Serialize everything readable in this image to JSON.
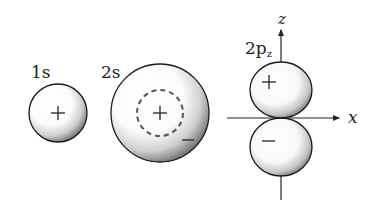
{
  "diagram": {
    "orbitals": [
      {
        "id": "1s",
        "label": "1s",
        "signs": [
          "+"
        ],
        "has_node": false
      },
      {
        "id": "2s",
        "label": "2s",
        "signs": [
          "+",
          "−"
        ],
        "has_node": true,
        "node_style": "dashed"
      },
      {
        "id": "2pz",
        "label": "2p",
        "label_subscript": "z",
        "lobe_signs": {
          "upper": "+",
          "lower": "−"
        }
      }
    ],
    "axes": {
      "vertical": "z",
      "horizontal": "x"
    },
    "colors": {
      "outline": "#1a1a1a",
      "shading": "#6b6b6b",
      "background": "#ffffff"
    }
  }
}
